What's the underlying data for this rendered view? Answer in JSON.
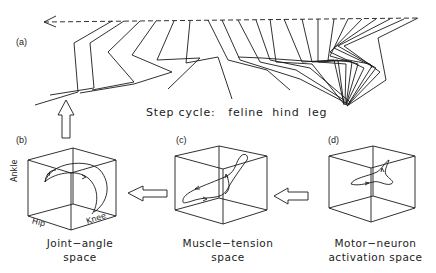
{
  "figure": {
    "panels": [
      {
        "id": "a",
        "label": "(a)",
        "title": "Step cycle:   feline  hind  leg"
      },
      {
        "id": "b",
        "label": "(b)",
        "caption_line1": "Joint−angle",
        "caption_line2": "space",
        "axes": {
          "vertical": "Ankle",
          "left": "Hip",
          "right": "Knee"
        }
      },
      {
        "id": "c",
        "label": "(c)",
        "caption_line1": "Muscle−tension",
        "caption_line2": "space"
      },
      {
        "id": "d",
        "label": "(d)",
        "caption_line1": "Motor−neuron",
        "caption_line2": "activation  space"
      }
    ],
    "arrows": [
      {
        "from": "d",
        "to": "c",
        "direction": "left"
      },
      {
        "from": "c",
        "to": "b",
        "direction": "left"
      },
      {
        "from": "b",
        "to": "a",
        "direction": "up"
      }
    ],
    "stroke_color": "#1a1a1a"
  }
}
